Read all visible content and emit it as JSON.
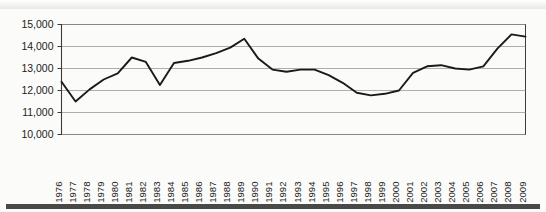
{
  "chart_data": {
    "type": "line",
    "title": "",
    "subtitle": "",
    "xlabel": "",
    "ylabel": "",
    "grid": true,
    "legend": false,
    "legend_position": "none",
    "xlim": [
      1976,
      2009
    ],
    "ylim": [
      10000,
      15000
    ],
    "y_tick_step": 1000,
    "y_ticks": [
      10000,
      11000,
      12000,
      13000,
      14000,
      15000
    ],
    "y_tick_labels": [
      "10,000",
      "11,000",
      "12,000",
      "13,000",
      "14,000",
      "15,000"
    ],
    "categories": [
      "1976",
      "1977",
      "1978",
      "1979",
      "1980",
      "1981",
      "1982",
      "1983",
      "1984",
      "1985",
      "1986",
      "1987",
      "1988",
      "1989",
      "1990",
      "1991",
      "1992",
      "1993",
      "1994",
      "1995",
      "1996",
      "1997",
      "1998",
      "1999",
      "2000",
      "2001",
      "2002",
      "2003",
      "2004",
      "2005",
      "2006",
      "2007",
      "2008",
      "2009"
    ],
    "values": [
      12400,
      11500,
      12050,
      12500,
      12780,
      13500,
      13300,
      12250,
      13250,
      13350,
      13500,
      13700,
      13950,
      14350,
      13450,
      12950,
      12850,
      12950,
      12950,
      12700,
      12350,
      11900,
      11780,
      11850,
      12000,
      12800,
      13100,
      13150,
      13000,
      12950,
      13100,
      13900,
      14550,
      14450
    ],
    "series": [
      {
        "name": "series-1",
        "color": "#1a1a1a",
        "values": [
          12400,
          11500,
          12050,
          12500,
          12780,
          13500,
          13300,
          12250,
          13250,
          13350,
          13500,
          13700,
          13950,
          14350,
          13450,
          12950,
          12850,
          12950,
          12950,
          12700,
          12350,
          11900,
          11780,
          11850,
          12000,
          12800,
          13100,
          13150,
          13000,
          12950,
          13100,
          13900,
          14550,
          14450
        ]
      }
    ],
    "annotations": [],
    "colors": {
      "line": "#1a1a1a",
      "grid": "#9a9a9a",
      "axis": "#3b3b3b",
      "background": "#fbfbfa",
      "text": "#1d1d1d"
    }
  }
}
